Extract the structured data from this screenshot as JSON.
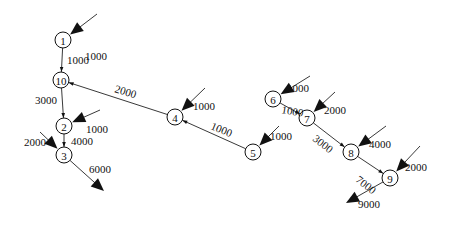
{
  "diagram": {
    "type": "network-flow",
    "nodes": [
      {
        "id": "1",
        "label": "1"
      },
      {
        "id": "10",
        "label": "10"
      },
      {
        "id": "2",
        "label": "2"
      },
      {
        "id": "3",
        "label": "3"
      },
      {
        "id": "4",
        "label": "4"
      },
      {
        "id": "5",
        "label": "5"
      },
      {
        "id": "6",
        "label": "6"
      },
      {
        "id": "7",
        "label": "7"
      },
      {
        "id": "8",
        "label": "8"
      },
      {
        "id": "9",
        "label": "9"
      }
    ],
    "edges": [
      {
        "from": "1",
        "to": "10",
        "label": "1000"
      },
      {
        "from": "10",
        "to": "2",
        "label": "3000"
      },
      {
        "from": "2",
        "to": "3",
        "label": "4000"
      },
      {
        "from": "4",
        "to": "10",
        "label": "2000"
      },
      {
        "from": "5",
        "to": "4",
        "label": "1000"
      },
      {
        "from": "6",
        "to": "7",
        "label": "1000"
      },
      {
        "from": "7",
        "to": "8",
        "label": "3000"
      },
      {
        "from": "8",
        "to": "9",
        "label": "7000"
      }
    ],
    "inflows": [
      {
        "node": "1",
        "label": "1000"
      },
      {
        "node": "2",
        "label": "1000"
      },
      {
        "node": "3",
        "label": "2000"
      },
      {
        "node": "4",
        "label": "1000"
      },
      {
        "node": "5",
        "label": "1000"
      },
      {
        "node": "6",
        "label": "1000"
      },
      {
        "node": "7",
        "label": "2000"
      },
      {
        "node": "8",
        "label": "4000"
      },
      {
        "node": "9",
        "label": "2000"
      }
    ],
    "outflows": [
      {
        "node": "3",
        "label": "6000"
      },
      {
        "node": "9",
        "label": "9000"
      }
    ]
  }
}
